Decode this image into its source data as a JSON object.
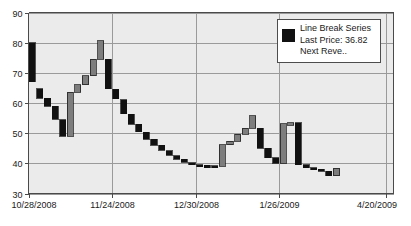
{
  "chart_data": {
    "type": "bar",
    "title": "",
    "subtitle": "",
    "xlabel": "",
    "ylabel": "",
    "grid": true,
    "ylim": [
      30,
      90
    ],
    "yticks": [
      30,
      40,
      50,
      60,
      70,
      80,
      90
    ],
    "xticks": [
      "10/28/2008",
      "11/24/2008",
      "12/30/2008",
      "1/26/2009",
      "4/20/2009"
    ],
    "xtick_positions": [
      0,
      11,
      22,
      33,
      47
    ],
    "xlim_index": [
      0,
      48
    ],
    "legend_position": "top-right",
    "colors": {
      "up_bar": "#7d7d7d",
      "down_bar": "#111111",
      "bar_border": "#111111",
      "plot_background": "#ebebeb",
      "gridline": "#9a9a9a",
      "axis": "#4a4a4a",
      "page_background": "#ffffff",
      "text": "#1a1a1a"
    },
    "series_name": "Line Break Series",
    "blocks": [
      {
        "index": 0,
        "open": 80.0,
        "close": 67.0,
        "direction": "down"
      },
      {
        "index": 1,
        "open": 64.8,
        "close": 61.6,
        "direction": "down"
      },
      {
        "index": 2,
        "open": 61.5,
        "close": 59.0,
        "direction": "down"
      },
      {
        "index": 3,
        "open": 58.9,
        "close": 54.6,
        "direction": "down"
      },
      {
        "index": 4,
        "open": 54.5,
        "close": 49.0,
        "direction": "down"
      },
      {
        "index": 5,
        "open": 49.0,
        "close": 63.6,
        "direction": "up"
      },
      {
        "index": 6,
        "open": 63.6,
        "close": 66.0,
        "direction": "up"
      },
      {
        "index": 7,
        "open": 66.0,
        "close": 69.0,
        "direction": "up"
      },
      {
        "index": 8,
        "open": 69.0,
        "close": 74.5,
        "direction": "up"
      },
      {
        "index": 9,
        "open": 74.5,
        "close": 80.6,
        "direction": "up"
      },
      {
        "index": 10,
        "open": 74.5,
        "close": 64.8,
        "direction": "down"
      },
      {
        "index": 11,
        "open": 64.6,
        "close": 61.4,
        "direction": "down"
      },
      {
        "index": 12,
        "open": 61.0,
        "close": 56.4,
        "direction": "down"
      },
      {
        "index": 13,
        "open": 56.3,
        "close": 53.0,
        "direction": "down"
      },
      {
        "index": 14,
        "open": 53.0,
        "close": 50.4,
        "direction": "down"
      },
      {
        "index": 15,
        "open": 50.3,
        "close": 48.0,
        "direction": "down"
      },
      {
        "index": 16,
        "open": 48.0,
        "close": 46.0,
        "direction": "down"
      },
      {
        "index": 17,
        "open": 46.0,
        "close": 44.3,
        "direction": "down"
      },
      {
        "index": 18,
        "open": 44.2,
        "close": 42.6,
        "direction": "down"
      },
      {
        "index": 19,
        "open": 42.5,
        "close": 41.3,
        "direction": "down"
      },
      {
        "index": 20,
        "open": 41.3,
        "close": 40.3,
        "direction": "down"
      },
      {
        "index": 21,
        "open": 40.2,
        "close": 39.6,
        "direction": "down"
      },
      {
        "index": 22,
        "open": 39.6,
        "close": 39.3,
        "direction": "down"
      },
      {
        "index": 23,
        "open": 39.3,
        "close": 39.2,
        "direction": "down"
      },
      {
        "index": 24,
        "open": 39.2,
        "close": 39.1,
        "direction": "down"
      },
      {
        "index": 25,
        "open": 39.1,
        "close": 46.2,
        "direction": "up"
      },
      {
        "index": 26,
        "open": 46.2,
        "close": 47.3,
        "direction": "up"
      },
      {
        "index": 27,
        "open": 47.3,
        "close": 49.6,
        "direction": "up"
      },
      {
        "index": 28,
        "open": 49.6,
        "close": 51.6,
        "direction": "up"
      },
      {
        "index": 29,
        "open": 51.6,
        "close": 55.8,
        "direction": "up"
      },
      {
        "index": 30,
        "open": 51.6,
        "close": 45.0,
        "direction": "down"
      },
      {
        "index": 31,
        "open": 45.0,
        "close": 41.8,
        "direction": "down"
      },
      {
        "index": 32,
        "open": 41.8,
        "close": 40.0,
        "direction": "down"
      },
      {
        "index": 33,
        "open": 40.0,
        "close": 53.2,
        "direction": "up"
      },
      {
        "index": 34,
        "open": 53.2,
        "close": 53.4,
        "direction": "up"
      },
      {
        "index": 35,
        "open": 53.4,
        "close": 39.6,
        "direction": "down"
      },
      {
        "index": 36,
        "open": 39.6,
        "close": 38.6,
        "direction": "down"
      },
      {
        "index": 37,
        "open": 38.6,
        "close": 38.1,
        "direction": "down"
      },
      {
        "index": 38,
        "open": 38.1,
        "close": 37.4,
        "direction": "down"
      },
      {
        "index": 39,
        "open": 37.4,
        "close": 35.9,
        "direction": "down"
      },
      {
        "index": 40,
        "open": 35.9,
        "close": 38.3,
        "direction": "up"
      }
    ]
  },
  "legend": {
    "series_label": "Line Break Series",
    "last_price_label": "Last Price: 36.82",
    "next_reversal_label": "Next Reve..",
    "swatch_color": "#111111"
  }
}
